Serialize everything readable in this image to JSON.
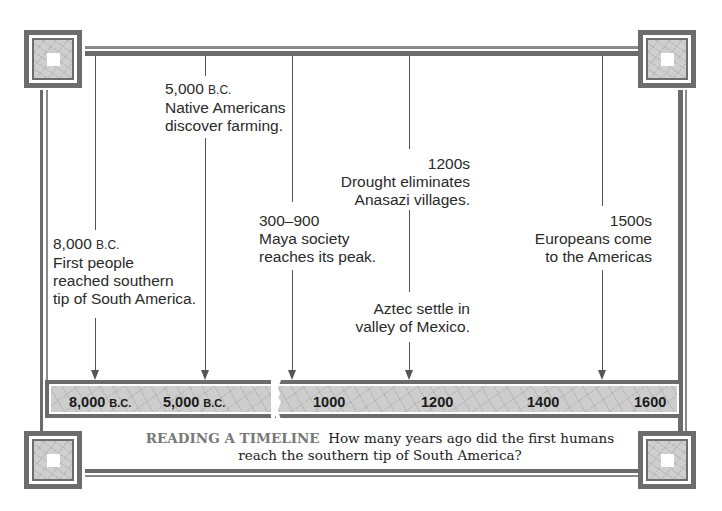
{
  "timeline": {
    "title": "Native American history timeline",
    "events": [
      {
        "date": "8,000",
        "era": "B.C.",
        "text": [
          "First people",
          "reached southern",
          "tip of South America."
        ]
      },
      {
        "date": "5,000",
        "era": "B.C.",
        "text": [
          "Native Americans",
          "discover farming."
        ]
      },
      {
        "date": "300–900",
        "era": "",
        "text": [
          "Maya society",
          "reaches its peak."
        ]
      },
      {
        "date": "1200s",
        "era": "",
        "text": [
          "Drought eliminates",
          "Anasazi villages."
        ]
      },
      {
        "date": "",
        "era": "",
        "text": [
          "Aztec settle in",
          "valley of Mexico."
        ]
      },
      {
        "date": "1500s",
        "era": "",
        "text": [
          "Europeans come",
          "to the Americas"
        ]
      }
    ],
    "axis": {
      "labels": [
        {
          "value": "8,000",
          "era": "B.C."
        },
        {
          "value": "5,000",
          "era": "B.C."
        },
        {
          "value": "1000",
          "era": ""
        },
        {
          "value": "1200",
          "era": ""
        },
        {
          "value": "1400",
          "era": ""
        },
        {
          "value": "1600",
          "era": ""
        }
      ],
      "break_marker": "axis-break"
    },
    "colors": {
      "frame": "#6b6b6b",
      "bar_fill": "#cdcdcd",
      "text": "#222222",
      "caption_keyword": "#777777"
    }
  },
  "caption": {
    "keyword": "READING A TIMELINE",
    "question": "How many years ago did the first humans reach the southern tip of South America?",
    "line1": "How many years ago did the first humans",
    "line2": "reach the southern tip of South America?"
  }
}
